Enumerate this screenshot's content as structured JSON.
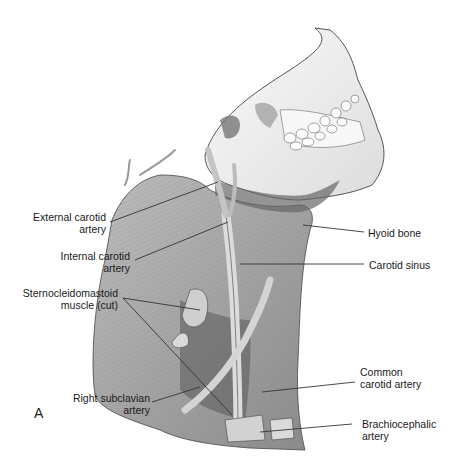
{
  "figure": {
    "panel_letter": "A",
    "labels": {
      "external_carotid": [
        "External carotid",
        "artery"
      ],
      "internal_carotid": [
        "Internal carotid",
        "artery"
      ],
      "sternocleidomastoid": [
        "Sternocleidomastoid",
        "muscle (cut)"
      ],
      "right_subclavian": [
        "Right subclavian",
        "artery"
      ],
      "hyoid_bone": [
        "Hyoid bone"
      ],
      "carotid_sinus": [
        "Carotid sinus"
      ],
      "common_carotid": [
        "Common",
        "carotid artery"
      ],
      "brachiocephalic": [
        "Brachiocephalic",
        "artery"
      ]
    },
    "colors": {
      "line": "#333333",
      "bone": "#f2f2f2",
      "muscle": "#a8a8a8",
      "muscle_dark": "#6e6e6e",
      "vessel": "#c8c8c8"
    }
  }
}
